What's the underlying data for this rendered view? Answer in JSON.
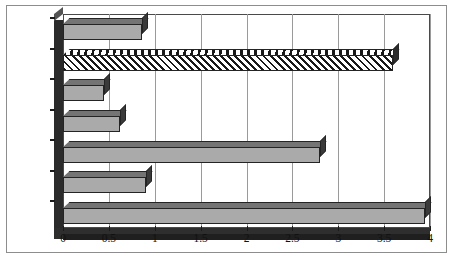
{
  "chart_data": {
    "type": "bar",
    "orientation": "horizontal",
    "title": "",
    "subtitle": "",
    "xlabel": "",
    "ylabel": "",
    "categories": [
      "India",
      "Vietnam",
      "Indonesia",
      "Philippines",
      "China",
      "Thailand",
      "Malaysia"
    ],
    "values": [
      0.86,
      3.6,
      0.45,
      0.62,
      2.8,
      0.9,
      3.95
    ],
    "series": [
      {
        "name": "value",
        "values": [
          0.86,
          3.6,
          0.45,
          0.62,
          2.8,
          0.9,
          3.95
        ]
      }
    ],
    "xlim": [
      0,
      4
    ],
    "ylim": null,
    "xticks": [
      0,
      0.5,
      1,
      1.5,
      2,
      2.5,
      3,
      3.5,
      4
    ],
    "xtick_labels": [
      "0",
      "0.5",
      "1",
      "1.5",
      "2",
      "2.5",
      "3",
      "3.5",
      "4"
    ],
    "grid": "vertical",
    "legend": null,
    "legend_position": "none",
    "annotations": [],
    "bar_styles": [
      {
        "category": "India",
        "fill": "solid-gray"
      },
      {
        "category": "Vietnam",
        "fill": "diagonal-hatch"
      },
      {
        "category": "Indonesia",
        "fill": "solid-gray"
      },
      {
        "category": "Philippines",
        "fill": "solid-gray"
      },
      {
        "category": "China",
        "fill": "solid-gray"
      },
      {
        "category": "Thailand",
        "fill": "solid-gray"
      },
      {
        "category": "Malaysia",
        "fill": "solid-gray"
      }
    ],
    "colors": {
      "bar_fill": "#aaaaaa",
      "bar_outline": "#242424",
      "bar_top_face": "#747474",
      "bar_side_face": "#3a3a3a",
      "hatch_color": "#181818",
      "hatch_background": "#ffffff",
      "gridline": "#9a9a9a",
      "axis_wall": "#2b2b2b",
      "floor": "#2e2e2e",
      "plot_border": "#4a4a4a",
      "outer_frame": "#8d8d8d",
      "background": "#ffffff",
      "text": "#111111"
    }
  }
}
